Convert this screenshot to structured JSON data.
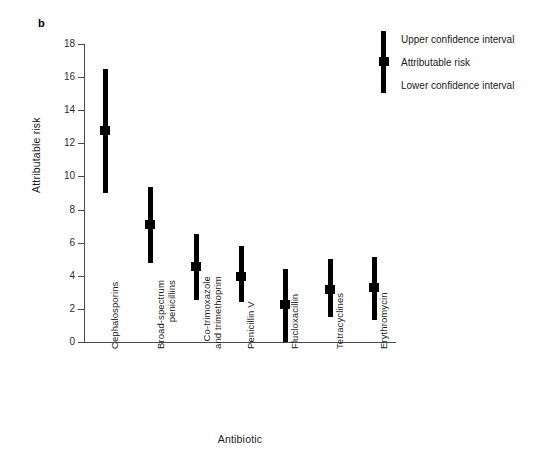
{
  "figure": {
    "panel_letter": "b"
  },
  "chart_data": {
    "type": "scatter",
    "title": "",
    "xlabel": "Antibiotic",
    "ylabel": "Attributable risk",
    "ylim": [
      0,
      18
    ],
    "yticks": [
      0,
      2,
      4,
      6,
      8,
      10,
      12,
      14,
      16,
      18
    ],
    "ytick_labels": [
      "0",
      "2",
      "4",
      "6",
      "8",
      "10",
      "12",
      "14",
      "16",
      "18"
    ],
    "grid": false,
    "legend_position": "top-right",
    "categories": [
      "Cephalosporins",
      "Broad-spectrum penicillins",
      "Co-trimoxazole and trimethoprim",
      "Penicillin V",
      "Flucloxacillin",
      "Tetracyclines",
      "Erythromycin"
    ],
    "category_lines": [
      [
        "Cephalosporins"
      ],
      [
        "Broad-spectrum",
        "penicillins"
      ],
      [
        "Co-trimoxazole",
        "and trimethoprim"
      ],
      [
        "Penicillin V"
      ],
      [
        "Flucloxacillin"
      ],
      [
        "Tetracyclines"
      ],
      [
        "Erythromycin"
      ]
    ],
    "series": [
      {
        "name": "Attributable risk",
        "values": [
          12.8,
          7.1,
          4.55,
          3.95,
          2.25,
          3.2,
          3.3
        ]
      },
      {
        "name": "Upper confidence interval",
        "values": [
          16.5,
          9.35,
          6.5,
          5.8,
          4.4,
          5.0,
          5.15
        ]
      },
      {
        "name": "Lower confidence interval",
        "values": [
          9.0,
          4.8,
          2.55,
          2.4,
          0.0,
          1.5,
          1.3
        ]
      }
    ],
    "points": [
      {
        "category": "Cephalosporins",
        "risk": 12.8,
        "upper": 16.5,
        "lower": 9.0
      },
      {
        "category": "Broad-spectrum penicillins",
        "risk": 7.1,
        "upper": 9.35,
        "lower": 4.8
      },
      {
        "category": "Co-trimoxazole and trimethoprim",
        "risk": 4.55,
        "upper": 6.5,
        "lower": 2.55
      },
      {
        "category": "Penicillin V",
        "risk": 3.95,
        "upper": 5.8,
        "lower": 2.4
      },
      {
        "category": "Flucloxacillin",
        "risk": 2.25,
        "upper": 4.4,
        "lower": 0.0
      },
      {
        "category": "Tetracyclines",
        "risk": 3.2,
        "upper": 5.0,
        "lower": 1.5
      },
      {
        "category": "Erythromycin",
        "risk": 3.3,
        "upper": 5.15,
        "lower": 1.3
      }
    ],
    "legend": [
      "Upper confidence interval",
      "Attributable risk",
      "Lower confidence interval"
    ],
    "colors": {
      "marker": "#000000",
      "axis": "#4a4a4a",
      "text": "#1a1a1a",
      "background": "#ffffff"
    }
  }
}
